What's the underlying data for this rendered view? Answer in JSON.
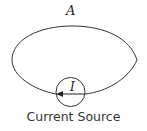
{
  "diagram": {
    "loop_label": "A",
    "current_label": "I",
    "caption": "Current Source",
    "colors": {
      "stroke": "#333333",
      "background": "#ffffff"
    },
    "elements": [
      {
        "type": "wire-loop",
        "description": "closed loop wire from right side of current source around to left side"
      },
      {
        "type": "current-source",
        "symbol": "circle with arrow pointing left",
        "label": "I"
      }
    ]
  }
}
